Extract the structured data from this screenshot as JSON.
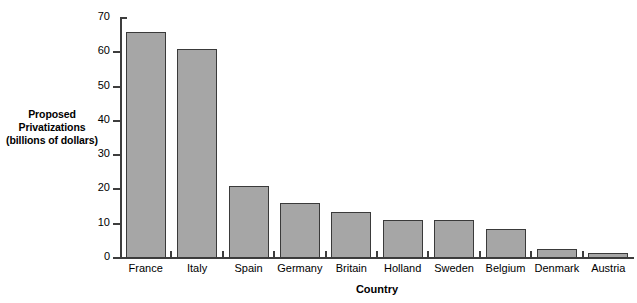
{
  "chart_data": {
    "type": "bar",
    "title": "",
    "categories": [
      "France",
      "Italy",
      "Spain",
      "Germany",
      "Britain",
      "Holland",
      "Sweden",
      "Belgium",
      "Denmark",
      "Austria"
    ],
    "values": [
      66,
      61,
      21,
      16,
      13.5,
      11,
      11,
      8.5,
      2.5,
      1.5
    ],
    "xlabel": "Country",
    "ylabel": "Proposed Privatizations (billions of dollars)",
    "ylabel_lines": [
      "Proposed",
      "Privatizations",
      "(billions of dollars)"
    ],
    "ylim": [
      0,
      70
    ],
    "yticks": [
      0,
      10,
      20,
      30,
      40,
      50,
      60,
      70
    ],
    "ytick_labels": [
      "0",
      "10",
      "20",
      "30",
      "40",
      "50",
      "60",
      "70"
    ],
    "grid": false,
    "legend": false,
    "bar_color": "#a6a6a6",
    "bar_border_color": "#3a3a3a",
    "axis_color": "#3d3d3d"
  }
}
